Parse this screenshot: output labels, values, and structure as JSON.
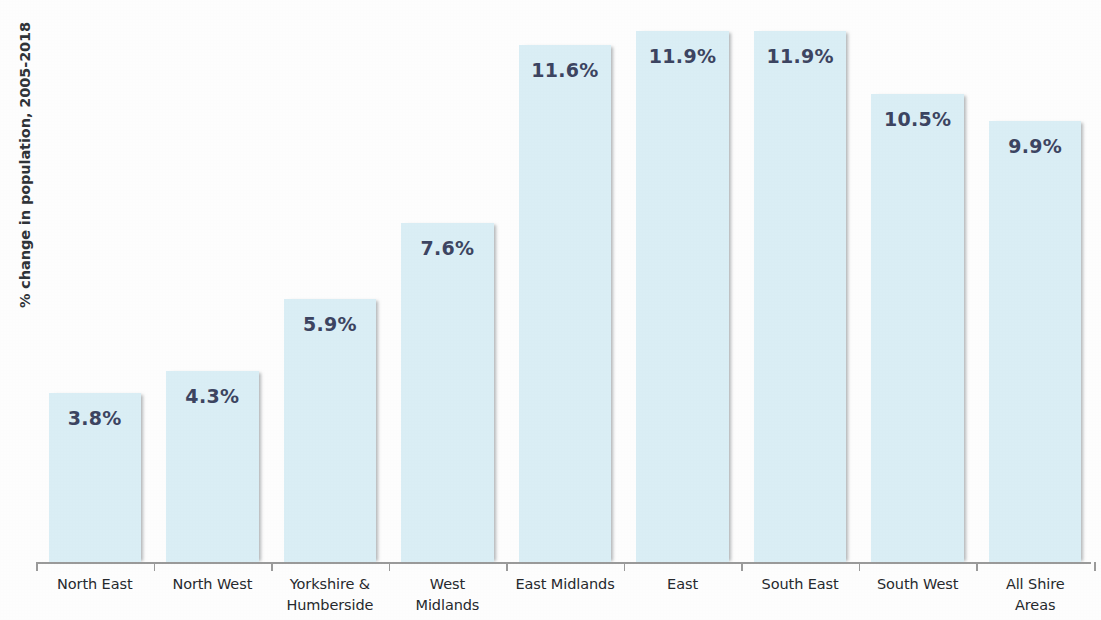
{
  "chart_data": {
    "type": "bar",
    "title": "",
    "xlabel": "",
    "ylabel": "% change in population, 2005-2018",
    "ylim": [
      0,
      12.6
    ],
    "grid": false,
    "legend": "none",
    "bar_color": "#daeef5",
    "label_color": "#3c4461",
    "axis_color": "#9a9a9a",
    "categories": [
      "North East",
      "North West",
      "Yorkshire & Humberside",
      "West Midlands",
      "East Midlands",
      "East",
      "South East",
      "South West",
      "All Shire Areas"
    ],
    "category_lines": [
      [
        "North East"
      ],
      [
        "North West"
      ],
      [
        "Yorkshire &",
        "Humberside"
      ],
      [
        "West",
        "Midlands"
      ],
      [
        "East Midlands"
      ],
      [
        "East"
      ],
      [
        "South East"
      ],
      [
        "South West"
      ],
      [
        "All Shire",
        "Areas"
      ]
    ],
    "values": [
      3.8,
      4.3,
      5.9,
      7.6,
      11.6,
      11.9,
      11.9,
      10.5,
      9.9
    ],
    "value_labels": [
      "3.8%",
      "4.3%",
      "5.9%",
      "7.6%",
      "11.6%",
      "11.9%",
      "11.9%",
      "10.5%",
      "9.9%"
    ]
  }
}
